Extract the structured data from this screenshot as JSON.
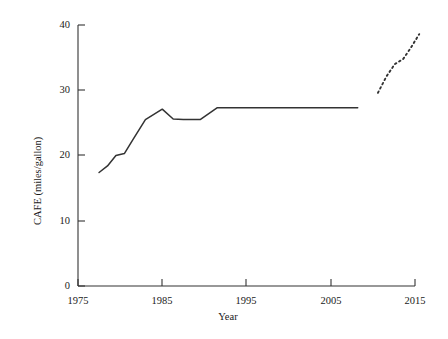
{
  "chart_data": {
    "type": "line",
    "title": "",
    "xlabel": "Year",
    "ylabel": "CAFE (miles/gallon)",
    "xlim": [
      1975,
      2015
    ],
    "ylim": [
      0,
      40
    ],
    "xticks": [
      "1975",
      "1985",
      "1995",
      "2005",
      "2015"
    ],
    "yticks": [
      "0",
      "10",
      "20",
      "30",
      "40"
    ],
    "grid": false,
    "legend": "none",
    "series": [
      {
        "name": "CAFE standard (historical)",
        "style": "solid",
        "color": "#333333",
        "x": [
          1977.5,
          1978.5,
          1979.5,
          1980.5,
          1981.5,
          1983.0,
          1985.0,
          1986.3,
          1987.5,
          1989.5,
          1991.5,
          2008.2
        ],
        "values": [
          17.4,
          18.4,
          20.0,
          20.3,
          22.4,
          25.5,
          27.1,
          25.6,
          25.5,
          25.5,
          27.3,
          27.3
        ]
      },
      {
        "name": "CAFE standard (projected)",
        "style": "dashed",
        "color": "#333333",
        "x": [
          2010.6,
          2011.6,
          2012.6,
          2013.6,
          2014.5,
          2015.5
        ],
        "values": [
          29.6,
          32.1,
          34.0,
          34.8,
          36.5,
          38.6
        ]
      }
    ]
  },
  "axis": {
    "x_title": "Year",
    "y_title": "CAFE (miles/gallon)"
  }
}
